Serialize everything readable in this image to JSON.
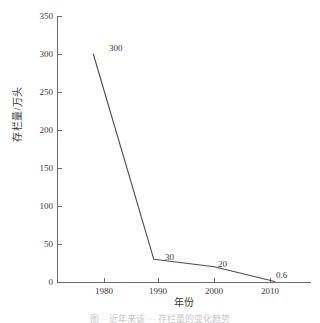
{
  "chart_data": {
    "type": "line",
    "title": "",
    "subtitle": "",
    "xlabel": "年份",
    "ylabel": "存栏量/万头",
    "x": [
      1980,
      1990,
      2000,
      2010
    ],
    "categories": [
      "1980",
      "1990",
      "2000",
      "2010"
    ],
    "values": [
      300,
      30,
      20,
      0.6
    ],
    "point_labels": [
      "300",
      "30",
      "20",
      "0.6"
    ],
    "series": [
      {
        "name": "存栏量",
        "values": [
          300,
          30,
          20,
          0.6
        ]
      }
    ],
    "xlim": [
      1974,
      2016
    ],
    "ylim": [
      0,
      350
    ],
    "yticks": [
      0,
      50,
      100,
      150,
      200,
      250,
      300,
      350
    ],
    "ytick_labels": [
      "0",
      "50",
      "100",
      "150",
      "200",
      "250",
      "300",
      "350"
    ],
    "xticks": [
      1980,
      1990,
      2000,
      2010
    ],
    "xtick_labels": [
      "1980",
      "1990",
      "2000",
      "2010"
    ],
    "grid": false,
    "legend": false,
    "legend_position": "none",
    "line_color": "#4a4a4a",
    "axis_color": "#6b6b6b",
    "text_color": "#3a3a3a",
    "background_color": "#ffffff"
  },
  "caption": {
    "text": "图 ·· 近年来该 ··· 存栏量的变化趋势"
  }
}
